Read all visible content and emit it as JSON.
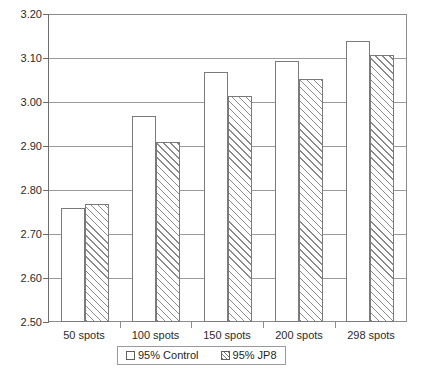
{
  "chart_data": {
    "type": "bar",
    "title": "",
    "subtitle": "",
    "xlabel": "",
    "ylabel": "",
    "categories": [
      "50 spots",
      "100 spots",
      "150 spots",
      "200 spots",
      "298 spots"
    ],
    "series": [
      {
        "name": "95% Control",
        "values": [
          2.76,
          2.97,
          3.07,
          3.095,
          3.14
        ],
        "fill": "solid-white"
      },
      {
        "name": "95% JP8",
        "values": [
          2.77,
          2.91,
          3.015,
          3.055,
          3.11
        ],
        "fill": "diagonal-hatch"
      }
    ],
    "ylim": [
      2.5,
      3.2
    ],
    "yticks": [
      "3.20",
      "3.10",
      "3.00",
      "2.90",
      "2.80",
      "2.70",
      "2.60",
      "2.50"
    ],
    "ytick_values": [
      3.2,
      3.1,
      3.0,
      2.9,
      2.8,
      2.7,
      2.6,
      2.5
    ],
    "grid": true,
    "grid_axis": "y",
    "legend": {
      "position": "bottom",
      "entries": [
        "95% Control",
        "95% JP8"
      ]
    },
    "colors": {
      "axis": "#6d6d6d",
      "grid": "#9a9a9a",
      "bar_outline": "#7a7a7a",
      "bar_control_fill": "#ffffff",
      "bar_jp8_hatch": "#8a8a8a",
      "text": "#222222",
      "background": "#ffffff"
    }
  }
}
